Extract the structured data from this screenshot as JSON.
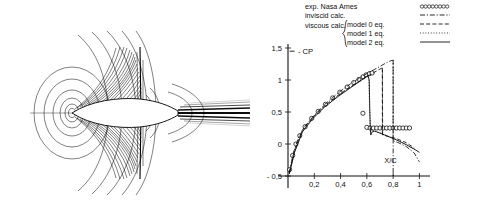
{
  "figure": {
    "panels": [
      "flow-field-contours",
      "pressure-coefficient-plot"
    ]
  },
  "contour_panel": {
    "name": "transonic airfoil flow field contour plot",
    "description": "Contour lines around a symmetric airfoil with shock and wake"
  },
  "legend": {
    "entries": [
      {
        "label": "exp. Nasa Ames",
        "style": "circles"
      },
      {
        "label": "inviscid calc.",
        "style": "dashdot"
      },
      {
        "label": "model 0 eq.",
        "style": "dashed"
      },
      {
        "label": "model 1 eq.",
        "style": "dotted"
      },
      {
        "label": "model 2 eq.",
        "style": "solid"
      }
    ],
    "group_label": "viscous calc.",
    "brace": "{"
  },
  "chart_data": {
    "type": "line",
    "title": "",
    "xlabel": "X/C",
    "ylabel": "- CP",
    "xlim": [
      0,
      1.05
    ],
    "ylim": [
      -0.5,
      1.5
    ],
    "xticks": [
      "0,2",
      "0,4",
      "0,6",
      "0,8",
      "1"
    ],
    "xtickvals": [
      0.2,
      0.4,
      0.6,
      0.8,
      1.0
    ],
    "yticks": [
      "1,5",
      "1",
      "0,5",
      "0",
      "- 0,5"
    ],
    "ytickvals": [
      1.5,
      1.0,
      0.5,
      0.0,
      -0.5
    ],
    "grid": false,
    "legend_position": "top-right",
    "series": [
      {
        "name": "exp. Nasa Ames",
        "style": "circles",
        "points": [
          [
            0.012,
            -0.4
          ],
          [
            0.035,
            -0.18
          ],
          [
            0.06,
            0.0
          ],
          [
            0.09,
            0.13
          ],
          [
            0.13,
            0.27
          ],
          [
            0.18,
            0.4
          ],
          [
            0.23,
            0.51
          ],
          [
            0.285,
            0.62
          ],
          [
            0.34,
            0.72
          ],
          [
            0.395,
            0.81
          ],
          [
            0.45,
            0.89
          ],
          [
            0.5,
            0.96
          ],
          [
            0.54,
            1.01
          ],
          [
            0.57,
            1.05
          ],
          [
            0.595,
            1.08
          ],
          [
            0.62,
            1.1
          ],
          [
            0.64,
            1.11
          ],
          [
            0.57,
            0.48
          ],
          [
            0.6,
            0.26
          ],
          [
            0.625,
            0.25
          ],
          [
            0.65,
            0.25
          ],
          [
            0.675,
            0.25
          ],
          [
            0.7,
            0.25
          ],
          [
            0.725,
            0.25
          ],
          [
            0.75,
            0.25
          ],
          [
            0.775,
            0.25
          ],
          [
            0.8,
            0.25
          ],
          [
            0.825,
            0.25
          ],
          [
            0.85,
            0.25
          ],
          [
            0.875,
            0.25
          ],
          [
            0.9,
            0.25
          ],
          [
            0.925,
            0.25
          ]
        ]
      },
      {
        "name": "inviscid calc.",
        "style": "dashdot",
        "points": [
          [
            0.01,
            -0.45
          ],
          [
            0.04,
            -0.14
          ],
          [
            0.08,
            0.1
          ],
          [
            0.13,
            0.28
          ],
          [
            0.2,
            0.45
          ],
          [
            0.28,
            0.62
          ],
          [
            0.36,
            0.76
          ],
          [
            0.44,
            0.89
          ],
          [
            0.52,
            1.0
          ],
          [
            0.6,
            1.1
          ],
          [
            0.68,
            1.19
          ],
          [
            0.74,
            1.26
          ],
          [
            0.78,
            1.3
          ],
          [
            0.8,
            1.31
          ],
          [
            0.8,
            0.05
          ],
          [
            0.84,
            0.02
          ],
          [
            0.9,
            -0.04
          ],
          [
            0.96,
            -0.14
          ],
          [
            1.0,
            -0.28
          ]
        ]
      },
      {
        "name": "model 0 eq.",
        "style": "dashed",
        "points": [
          [
            0.01,
            -0.45
          ],
          [
            0.05,
            -0.1
          ],
          [
            0.11,
            0.22
          ],
          [
            0.19,
            0.42
          ],
          [
            0.28,
            0.6
          ],
          [
            0.38,
            0.76
          ],
          [
            0.47,
            0.89
          ],
          [
            0.56,
            1.0
          ],
          [
            0.63,
            1.09
          ],
          [
            0.69,
            1.16
          ],
          [
            0.718,
            1.19
          ],
          [
            0.72,
            0.14
          ],
          [
            0.76,
            0.12
          ],
          [
            0.83,
            0.08
          ],
          [
            0.9,
            0.02
          ],
          [
            0.96,
            -0.06
          ]
        ]
      },
      {
        "name": "model 1 eq.",
        "style": "dotted",
        "points": [
          [
            0.01,
            -0.46
          ],
          [
            0.05,
            -0.12
          ],
          [
            0.11,
            0.2
          ],
          [
            0.19,
            0.41
          ],
          [
            0.28,
            0.59
          ],
          [
            0.38,
            0.75
          ],
          [
            0.47,
            0.88
          ],
          [
            0.54,
            0.98
          ],
          [
            0.58,
            1.04
          ],
          [
            0.605,
            1.07
          ],
          [
            0.615,
            1.02
          ],
          [
            0.62,
            0.62
          ],
          [
            0.625,
            0.3
          ],
          [
            0.628,
            0.18
          ],
          [
            0.635,
            0.22
          ],
          [
            0.65,
            0.21
          ],
          [
            0.68,
            0.19
          ],
          [
            0.74,
            0.14
          ],
          [
            0.8,
            0.09
          ],
          [
            0.87,
            0.02
          ],
          [
            0.93,
            -0.05
          ],
          [
            0.98,
            -0.1
          ]
        ]
      },
      {
        "name": "model 2 eq.",
        "style": "solid",
        "points": [
          [
            0.01,
            -0.47
          ],
          [
            0.05,
            -0.13
          ],
          [
            0.11,
            0.19
          ],
          [
            0.19,
            0.4
          ],
          [
            0.28,
            0.58
          ],
          [
            0.38,
            0.74
          ],
          [
            0.47,
            0.87
          ],
          [
            0.54,
            0.97
          ],
          [
            0.58,
            1.03
          ],
          [
            0.608,
            1.07
          ],
          [
            0.618,
            1.0
          ],
          [
            0.622,
            0.55
          ],
          [
            0.626,
            0.26
          ],
          [
            0.63,
            0.14
          ],
          [
            0.64,
            0.19
          ],
          [
            0.66,
            0.2
          ],
          [
            0.7,
            0.17
          ],
          [
            0.76,
            0.12
          ],
          [
            0.83,
            0.06
          ],
          [
            0.9,
            -0.01
          ],
          [
            0.96,
            -0.08
          ],
          [
            1.0,
            -0.13
          ]
        ]
      }
    ],
    "annotations": [
      {
        "text": "X/C",
        "x": 0.78,
        "y": -0.3
      },
      {
        "text": "- CP",
        "x": 0.06,
        "y": 1.45
      }
    ]
  }
}
